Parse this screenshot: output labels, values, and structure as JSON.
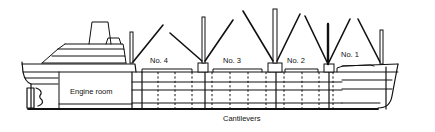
{
  "diagram": {
    "labels": {
      "engine_room": "Engine room",
      "hold_4": "No. 4",
      "hold_3": "No. 3",
      "hold_2": "No. 2",
      "hold_1": "No. 1",
      "cantilevers": "Cantilevers"
    },
    "colors": {
      "line": "#111111",
      "background": "#ffffff"
    }
  }
}
